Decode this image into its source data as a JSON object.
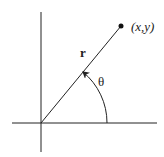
{
  "diagram": {
    "point_label": "(x,y)",
    "radius_label": "r",
    "angle_label": "θ",
    "colors": {
      "stroke": "#222222",
      "background": "#ffffff"
    }
  }
}
